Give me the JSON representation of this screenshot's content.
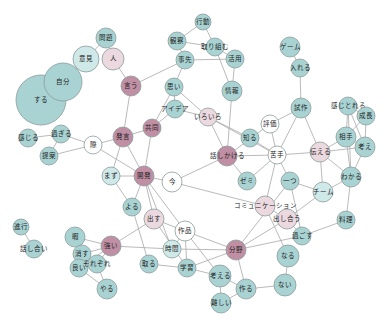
{
  "diagram": {
    "type": "co-occurrence network",
    "colors": {
      "teal": "#a9d3d3",
      "light_teal": "#cfe8e8",
      "pink": "#c08fa4",
      "light_pink": "#ecd9df",
      "white": "#ffffff",
      "edge": "#a8a8a8"
    },
    "nodes": [
      {
        "id": "n_suru",
        "label": "する",
        "x": 41,
        "y": 100,
        "r": 25,
        "color": "teal"
      },
      {
        "id": "n_jibun",
        "label": "自分",
        "x": 63,
        "y": 82,
        "r": 19,
        "color": "teal"
      },
      {
        "id": "n_iken",
        "label": "意見",
        "x": 86,
        "y": 59,
        "r": 13,
        "color": "light_teal"
      },
      {
        "id": "n_mondai",
        "label": "問題",
        "x": 106,
        "y": 38,
        "r": 10,
        "color": "teal"
      },
      {
        "id": "n_hito",
        "label": "人",
        "x": 113,
        "y": 59,
        "r": 11,
        "color": "light_pink"
      },
      {
        "id": "n_iu",
        "label": "言う",
        "x": 131,
        "y": 86,
        "r": 10,
        "color": "pink"
      },
      {
        "id": "n_kodo",
        "label": "行動",
        "x": 203,
        "y": 22,
        "r": 8,
        "color": "teal"
      },
      {
        "id": "n_kansatsu",
        "label": "観察",
        "x": 177,
        "y": 41,
        "r": 9,
        "color": "teal"
      },
      {
        "id": "n_torikumu",
        "label": "取り組む",
        "x": 215,
        "y": 47,
        "r": 9,
        "color": "teal"
      },
      {
        "id": "n_aite_top",
        "label": "事先",
        "x": 185,
        "y": 60,
        "r": 9,
        "color": "teal"
      },
      {
        "id": "n_riyo",
        "label": "活用",
        "x": 235,
        "y": 59,
        "r": 9,
        "color": "teal"
      },
      {
        "id": "n_omoi",
        "label": "思い",
        "x": 174,
        "y": 87,
        "r": 9,
        "color": "teal"
      },
      {
        "id": "n_joho",
        "label": "情報",
        "x": 232,
        "y": 91,
        "r": 10,
        "color": "teal"
      },
      {
        "id": "n_idea",
        "label": "アイデア",
        "x": 175,
        "y": 109,
        "r": 9,
        "color": "teal"
      },
      {
        "id": "n_iroiro",
        "label": "いろいろ",
        "x": 208,
        "y": 117,
        "r": 9,
        "color": "light_pink"
      },
      {
        "id": "n_kyodo",
        "label": "共同",
        "x": 152,
        "y": 128,
        "r": 9,
        "color": "pink"
      },
      {
        "id": "n_hatsugen",
        "label": "発言",
        "x": 123,
        "y": 137,
        "r": 10,
        "color": "pink"
      },
      {
        "id": "n_sai",
        "label": "際",
        "x": 93,
        "y": 145,
        "r": 9,
        "color": "white"
      },
      {
        "id": "n_kanjiru",
        "label": "感じる",
        "x": 28,
        "y": 138,
        "r": 9,
        "color": "teal"
      },
      {
        "id": "n_sugiru",
        "label": "過ぎる",
        "x": 61,
        "y": 134,
        "r": 9,
        "color": "teal"
      },
      {
        "id": "n_teian",
        "label": "提案",
        "x": 49,
        "y": 156,
        "r": 9,
        "color": "teal"
      },
      {
        "id": "n_mazu",
        "label": "まず",
        "x": 111,
        "y": 176,
        "r": 9,
        "color": "light_teal"
      },
      {
        "id": "n_kaihatsu",
        "label": "開発",
        "x": 144,
        "y": 176,
        "r": 10,
        "color": "pink"
      },
      {
        "id": "n_ima",
        "label": "今",
        "x": 172,
        "y": 182,
        "r": 10,
        "color": "white"
      },
      {
        "id": "n_shikkou",
        "label": "進行",
        "x": 21,
        "y": 227,
        "r": 8,
        "color": "teal"
      },
      {
        "id": "n_hanashiai",
        "label": "話し合い",
        "x": 34,
        "y": 249,
        "r": 9,
        "color": "teal"
      },
      {
        "id": "n_yoru",
        "label": "よる",
        "x": 132,
        "y": 207,
        "r": 9,
        "color": "teal"
      },
      {
        "id": "n_dasu",
        "label": "出す",
        "x": 154,
        "y": 219,
        "r": 10,
        "color": "light_pink"
      },
      {
        "id": "n_sakuhin",
        "label": "作品",
        "x": 185,
        "y": 231,
        "r": 10,
        "color": "white"
      },
      {
        "id": "n_jikan",
        "label": "時間",
        "x": 172,
        "y": 249,
        "r": 9,
        "color": "light_teal"
      },
      {
        "id": "n_kokoro",
        "label": "取る",
        "x": 149,
        "y": 264,
        "r": 9,
        "color": "teal"
      },
      {
        "id": "n_gakushu",
        "label": "学習",
        "x": 187,
        "y": 268,
        "r": 9,
        "color": "teal"
      },
      {
        "id": "n_kangaeru",
        "label": "考える",
        "x": 220,
        "y": 276,
        "r": 11,
        "color": "teal"
      },
      {
        "id": "n_tsukuru",
        "label": "作る",
        "x": 246,
        "y": 289,
        "r": 10,
        "color": "teal"
      },
      {
        "id": "n_muzukashii",
        "label": "難しい",
        "x": 221,
        "y": 303,
        "r": 10,
        "color": "teal"
      },
      {
        "id": "n_bunya",
        "label": "分野",
        "x": 236,
        "y": 250,
        "r": 10,
        "color": "pink"
      },
      {
        "id": "n_naru",
        "label": "なる",
        "x": 288,
        "y": 256,
        "r": 11,
        "color": "teal"
      },
      {
        "id": "n_nai",
        "label": "ない",
        "x": 285,
        "y": 285,
        "r": 11,
        "color": "teal"
      },
      {
        "id": "n_kii",
        "label": "暇",
        "x": 75,
        "y": 237,
        "r": 10,
        "color": "teal"
      },
      {
        "id": "n_kesu",
        "label": "消す",
        "x": 82,
        "y": 254,
        "r": 9,
        "color": "teal"
      },
      {
        "id": "n_tanoshii",
        "label": "良い",
        "x": 79,
        "y": 268,
        "r": 9,
        "color": "teal"
      },
      {
        "id": "n_sorezore",
        "label": "それぞれ",
        "x": 97,
        "y": 264,
        "r": 9,
        "color": "teal"
      },
      {
        "id": "n_yaru",
        "label": "やる",
        "x": 107,
        "y": 289,
        "r": 10,
        "color": "teal"
      },
      {
        "id": "n_tsuyoi",
        "label": "強い",
        "x": 111,
        "y": 246,
        "r": 10,
        "color": "pink"
      },
      {
        "id": "n_game",
        "label": "ゲーム",
        "x": 290,
        "y": 47,
        "r": 10,
        "color": "teal"
      },
      {
        "id": "n_ireru",
        "label": "入れる",
        "x": 300,
        "y": 68,
        "r": 9,
        "color": "teal"
      },
      {
        "id": "n_shisaku",
        "label": "試作",
        "x": 301,
        "y": 108,
        "r": 10,
        "color": "teal"
      },
      {
        "id": "n_hyouka",
        "label": "評価",
        "x": 270,
        "y": 124,
        "r": 9,
        "color": "white"
      },
      {
        "id": "n_shiru",
        "label": "知る",
        "x": 250,
        "y": 138,
        "r": 9,
        "color": "teal"
      },
      {
        "id": "n_hanashikakeru",
        "label": "話しかける",
        "x": 227,
        "y": 156,
        "r": 10,
        "color": "pink"
      },
      {
        "id": "n_aite",
        "label": "苦手",
        "x": 277,
        "y": 155,
        "r": 9,
        "color": "white"
      },
      {
        "id": "n_tsutaeru",
        "label": "伝える",
        "x": 320,
        "y": 152,
        "r": 10,
        "color": "light_pink"
      },
      {
        "id": "n_omoidasu",
        "label": "感じとれる",
        "x": 348,
        "y": 106,
        "r": 9,
        "color": "teal"
      },
      {
        "id": "n_seichou",
        "label": "成長",
        "x": 366,
        "y": 116,
        "r": 9,
        "color": "teal"
      },
      {
        "id": "n_aite2",
        "label": "相手",
        "x": 346,
        "y": 137,
        "r": 10,
        "color": "teal"
      },
      {
        "id": "n_kangae",
        "label": "考え",
        "x": 365,
        "y": 147,
        "r": 10,
        "color": "teal"
      },
      {
        "id": "n_wakaru",
        "label": "わかる",
        "x": 351,
        "y": 177,
        "r": 10,
        "color": "teal"
      },
      {
        "id": "n_zemi",
        "label": "ゼミ",
        "x": 247,
        "y": 181,
        "r": 9,
        "color": "teal"
      },
      {
        "id": "n_hitotsu",
        "label": "一つ",
        "x": 290,
        "y": 181,
        "r": 9,
        "color": "teal"
      },
      {
        "id": "n_team",
        "label": "チーム",
        "x": 323,
        "y": 192,
        "r": 10,
        "color": "light_teal"
      },
      {
        "id": "n_comm",
        "label": "コミュニケーション",
        "x": 265,
        "y": 206,
        "r": 10,
        "color": "light_pink"
      },
      {
        "id": "n_hanashiau",
        "label": "出し合う",
        "x": 287,
        "y": 219,
        "r": 10,
        "color": "light_pink"
      },
      {
        "id": "n_ryori",
        "label": "料理",
        "x": 346,
        "y": 220,
        "r": 9,
        "color": "teal"
      },
      {
        "id": "n_sugosu",
        "label": "過ごす",
        "x": 302,
        "y": 236,
        "r": 9,
        "color": "teal"
      }
    ],
    "edges": [
      [
        "n_suru",
        "n_jibun"
      ],
      [
        "n_jibun",
        "n_iken"
      ],
      [
        "n_iken",
        "n_mondai"
      ],
      [
        "n_hito",
        "n_iu"
      ],
      [
        "n_iu",
        "n_aite_top"
      ],
      [
        "n_iu",
        "n_hatsugen"
      ],
      [
        "n_kodo",
        "n_kansatsu"
      ],
      [
        "n_kodo",
        "n_torikumu"
      ],
      [
        "n_kansatsu",
        "n_torikumu"
      ],
      [
        "n_kansatsu",
        "n_aite_top"
      ],
      [
        "n_torikumu",
        "n_riyo"
      ],
      [
        "n_torikumu",
        "n_joho"
      ],
      [
        "n_aite_top",
        "n_riyo"
      ],
      [
        "n_aite_top",
        "n_omoi"
      ],
      [
        "n_omoi",
        "n_idea"
      ],
      [
        "n_omoi",
        "n_iroiro"
      ],
      [
        "n_omoi",
        "n_kyodo"
      ],
      [
        "n_idea",
        "n_iroiro"
      ],
      [
        "n_idea",
        "n_kyodo"
      ],
      [
        "n_riyo",
        "n_joho"
      ],
      [
        "n_joho",
        "n_hanashikakeru"
      ],
      [
        "n_iroiro",
        "n_hanashikakeru"
      ],
      [
        "n_iroiro",
        "n_shiru"
      ],
      [
        "n_iroiro",
        "n_aite"
      ],
      [
        "n_kyodo",
        "n_hatsugen"
      ],
      [
        "n_kyodo",
        "n_kaihatsu"
      ],
      [
        "n_hatsugen",
        "n_sai"
      ],
      [
        "n_hatsugen",
        "n_kaihatsu"
      ],
      [
        "n_hatsugen",
        "n_mazu"
      ],
      [
        "n_sai",
        "n_sugiru"
      ],
      [
        "n_sai",
        "n_teian"
      ],
      [
        "n_sai",
        "n_kaihatsu"
      ],
      [
        "n_kanjiru",
        "n_sugiru"
      ],
      [
        "n_sugiru",
        "n_teian"
      ],
      [
        "n_mazu",
        "n_kaihatsu"
      ],
      [
        "n_kaihatsu",
        "n_ima"
      ],
      [
        "n_kaihatsu",
        "n_yoru"
      ],
      [
        "n_kaihatsu",
        "n_dasu"
      ],
      [
        "n_kaihatsu",
        "n_sakuhin"
      ],
      [
        "n_kaihatsu",
        "n_jikan"
      ],
      [
        "n_ima",
        "n_hanashikakeru"
      ],
      [
        "n_mazu",
        "n_yoru"
      ],
      [
        "n_yoru",
        "n_kokoro"
      ],
      [
        "n_dasu",
        "n_sakuhin"
      ],
      [
        "n_dasu",
        "n_tsuyoi"
      ],
      [
        "n_dasu",
        "n_gakushu"
      ],
      [
        "n_shikkou",
        "n_hanashiai"
      ],
      [
        "n_sakuhin",
        "n_jikan"
      ],
      [
        "n_sakuhin",
        "n_gakushu"
      ],
      [
        "n_sakuhin",
        "n_kangaeru"
      ],
      [
        "n_sakuhin",
        "n_bunya"
      ],
      [
        "n_jikan",
        "n_bunya"
      ],
      [
        "n_jikan",
        "n_tsuyoi"
      ],
      [
        "n_kokoro",
        "n_gakushu"
      ],
      [
        "n_gakushu",
        "n_bunya"
      ],
      [
        "n_gakushu",
        "n_kangaeru"
      ],
      [
        "n_kangaeru",
        "n_tsukuru"
      ],
      [
        "n_kangaeru",
        "n_muzukashii"
      ],
      [
        "n_tsukuru",
        "n_muzukashii"
      ],
      [
        "n_tsukuru",
        "n_bunya"
      ],
      [
        "n_tsukuru",
        "n_nai"
      ],
      [
        "n_bunya",
        "n_hanashiau"
      ],
      [
        "n_bunya",
        "n_sugosu"
      ],
      [
        "n_bunya",
        "n_hitotsu"
      ],
      [
        "n_naru",
        "n_nai"
      ],
      [
        "n_naru",
        "n_comm"
      ],
      [
        "n_kii",
        "n_tsuyoi"
      ],
      [
        "n_kii",
        "n_kesu"
      ],
      [
        "n_kesu",
        "n_tsuyoi"
      ],
      [
        "n_kesu",
        "n_tanoshii"
      ],
      [
        "n_kesu",
        "n_sorezore"
      ],
      [
        "n_tanoshii",
        "n_sorezore"
      ],
      [
        "n_tanoshii",
        "n_tsuyoi"
      ],
      [
        "n_tanoshii",
        "n_yaru"
      ],
      [
        "n_sorezore",
        "n_yaru"
      ],
      [
        "n_sorezore",
        "n_tsuyoi"
      ],
      [
        "n_game",
        "n_ireru"
      ],
      [
        "n_ireru",
        "n_shisaku"
      ],
      [
        "n_shisaku",
        "n_hyouka"
      ],
      [
        "n_shisaku",
        "n_aite"
      ],
      [
        "n_shisaku",
        "n_tsutaeru"
      ],
      [
        "n_hyouka",
        "n_aite"
      ],
      [
        "n_hyouka",
        "n_hanashikakeru"
      ],
      [
        "n_shiru",
        "n_aite"
      ],
      [
        "n_hanashikakeru",
        "n_aite"
      ],
      [
        "n_hanashikakeru",
        "n_zemi"
      ],
      [
        "n_aite",
        "n_tsutaeru"
      ],
      [
        "n_aite",
        "n_hitotsu"
      ],
      [
        "n_aite",
        "n_comm"
      ],
      [
        "n_aite",
        "n_zemi"
      ],
      [
        "n_tsutaeru",
        "n_aite2"
      ],
      [
        "n_tsutaeru",
        "n_kangae"
      ],
      [
        "n_tsutaeru",
        "n_wakaru"
      ],
      [
        "n_tsutaeru",
        "n_team"
      ],
      [
        "n_omoidasu",
        "n_aite2"
      ],
      [
        "n_omoidasu",
        "n_seichou"
      ],
      [
        "n_omoidasu",
        "n_kangae"
      ],
      [
        "n_omoidasu",
        "n_wakaru"
      ],
      [
        "n_seichou",
        "n_aite2"
      ],
      [
        "n_seichou",
        "n_kangae"
      ],
      [
        "n_aite2",
        "n_kangae"
      ],
      [
        "n_aite2",
        "n_wakaru"
      ],
      [
        "n_kangae",
        "n_wakaru"
      ],
      [
        "n_wakaru",
        "n_team"
      ],
      [
        "n_wakaru",
        "n_ryori"
      ],
      [
        "n_hitotsu",
        "n_team"
      ],
      [
        "n_hitotsu",
        "n_sugosu"
      ],
      [
        "n_team",
        "n_hanashiau"
      ],
      [
        "n_comm",
        "n_hanashiau"
      ],
      [
        "n_hanashiau",
        "n_sugosu"
      ],
      [
        "n_ryori",
        "n_sugosu"
      ],
      [
        "n_comm",
        "n_ima"
      ]
    ]
  }
}
